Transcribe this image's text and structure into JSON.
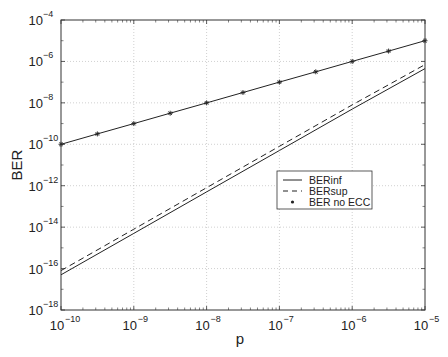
{
  "chart_data": {
    "type": "line",
    "title": "",
    "xlabel": "p",
    "ylabel": "BER",
    "xscale": "log",
    "yscale": "log",
    "xlim": [
      1e-10,
      1e-05
    ],
    "ylim": [
      1e-18,
      0.0001
    ],
    "grid": true,
    "legend_position": "center-right (inside plot)",
    "x_ticks": [
      {
        "base": "10",
        "exp": "−10",
        "value": 1e-10
      },
      {
        "base": "10",
        "exp": "−9",
        "value": 1e-09
      },
      {
        "base": "10",
        "exp": "−8",
        "value": 1e-08
      },
      {
        "base": "10",
        "exp": "−7",
        "value": 1e-07
      },
      {
        "base": "10",
        "exp": "−6",
        "value": 1e-06
      },
      {
        "base": "10",
        "exp": "−5",
        "value": 1e-05
      }
    ],
    "y_ticks": [
      {
        "base": "10",
        "exp": "−4",
        "value": 0.0001
      },
      {
        "base": "10",
        "exp": "−6",
        "value": 1e-06
      },
      {
        "base": "10",
        "exp": "−8",
        "value": 1e-08
      },
      {
        "base": "10",
        "exp": "−10",
        "value": 1e-10
      },
      {
        "base": "10",
        "exp": "−12",
        "value": 1e-12
      },
      {
        "base": "10",
        "exp": "−14",
        "value": 1e-14
      },
      {
        "base": "10",
        "exp": "−16",
        "value": 1e-16
      },
      {
        "base": "10",
        "exp": "−18",
        "value": 1e-18
      }
    ],
    "series": [
      {
        "name": "BERinf",
        "style": "solid",
        "marker": "none",
        "x": [
          1e-10,
          1e-09,
          1e-08,
          1e-07,
          1e-06,
          1e-05
        ],
        "values": [
          5e-17,
          5e-15,
          5e-13,
          5e-11,
          5e-09,
          4.5e-07
        ]
      },
      {
        "name": "BERsup",
        "style": "dashed",
        "marker": "none",
        "x": [
          1e-10,
          1e-09,
          1e-08,
          1e-07,
          1e-06,
          1e-05
        ],
        "values": [
          8e-17,
          8e-15,
          8e-13,
          8e-11,
          8e-09,
          7e-07
        ]
      },
      {
        "name": "BER no ECC",
        "style": "solid",
        "marker": "asterisk",
        "x": [
          1e-10,
          3.16e-10,
          1e-09,
          3.16e-09,
          1e-08,
          3.16e-08,
          1e-07,
          3.16e-07,
          1e-06,
          3.16e-06,
          1e-05
        ],
        "values": [
          1e-10,
          3.16e-10,
          1e-09,
          3.16e-09,
          1e-08,
          3.16e-08,
          1e-07,
          3.16e-07,
          1e-06,
          3.16e-06,
          1e-05
        ]
      }
    ]
  },
  "legend": {
    "items": [
      {
        "label": "BERinf",
        "style": "solid"
      },
      {
        "label": "BERsup",
        "style": "dashed"
      },
      {
        "label": "BER no ECC",
        "style": "marker"
      }
    ]
  },
  "axes": {
    "xlabel": "p",
    "ylabel": "BER"
  }
}
